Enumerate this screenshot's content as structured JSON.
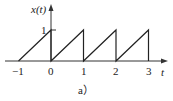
{
  "chart_data": {
    "type": "line",
    "title": "",
    "xlabel": "t",
    "ylabel": "x(t)",
    "caption": "a)",
    "x_ticks": [
      -1,
      0,
      1,
      2,
      3
    ],
    "x_tick_labels": [
      "−1",
      "0",
      "1",
      "2",
      "3"
    ],
    "y_ticks": [
      1
    ],
    "y_tick_labels": [
      "1"
    ],
    "xlim": [
      -1.4,
      3.5
    ],
    "ylim": [
      0,
      1.8
    ],
    "grid": false,
    "legend": null,
    "series": [
      {
        "name": "x(t) sawtooth",
        "points": [
          [
            -1,
            0
          ],
          [
            0,
            1
          ],
          [
            0,
            0
          ],
          [
            1,
            1
          ],
          [
            1,
            0
          ],
          [
            2,
            1
          ],
          [
            2,
            0
          ],
          [
            3,
            1
          ],
          [
            3,
            0
          ]
        ]
      }
    ],
    "color": "#222222"
  },
  "labels": {
    "ylabel": "x(t)",
    "xlabel": "t",
    "ytick": "1",
    "xticks": [
      "−1",
      "0",
      "1",
      "2",
      "3"
    ],
    "caption": "a）"
  }
}
